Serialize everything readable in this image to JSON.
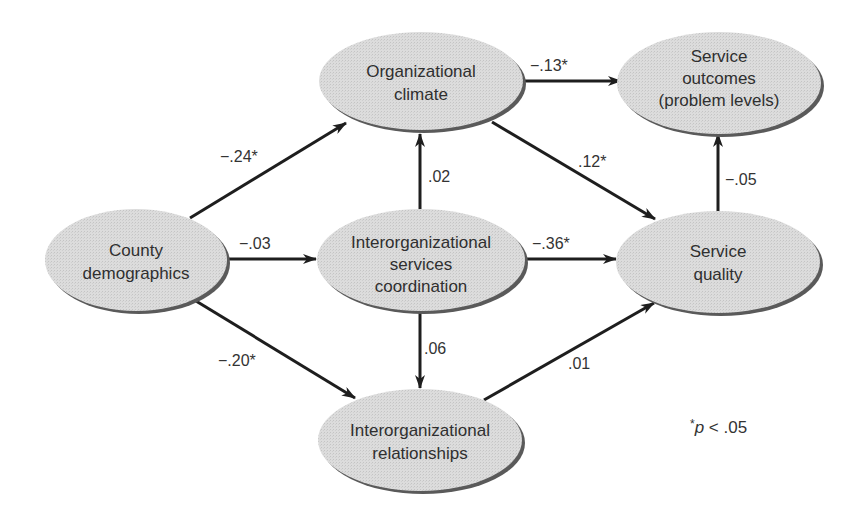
{
  "colors": {
    "node_fill": "#d9d9d9",
    "node_shadow": "#555555",
    "edge": "#1e1e1e",
    "text": "#2f2f2f"
  },
  "nodes": {
    "county": {
      "lines": [
        "County",
        "demographics"
      ]
    },
    "climate": {
      "lines": [
        "Organizational",
        "climate"
      ]
    },
    "outcomes": {
      "lines": [
        "Service",
        "outcomes",
        "(problem levels)"
      ]
    },
    "coordination": {
      "lines": [
        "Interorganizational",
        "services",
        "coordination"
      ]
    },
    "quality": {
      "lines": [
        "Service",
        "quality"
      ]
    },
    "relationships": {
      "lines": [
        "Interorganizational",
        "relationships"
      ]
    }
  },
  "edges": {
    "county_climate": {
      "label": "−.24*"
    },
    "county_coordination": {
      "label": "−.03"
    },
    "county_relationships": {
      "label": "−.20*"
    },
    "coordination_climate": {
      "label": ".02"
    },
    "coordination_relationships": {
      "label": ".06"
    },
    "climate_outcomes": {
      "label": "−.13*"
    },
    "climate_quality": {
      "label": ".12*"
    },
    "coordination_quality": {
      "label": "−.36*"
    },
    "relationships_quality": {
      "label": ".01"
    },
    "quality_outcomes": {
      "label": "−.05"
    }
  },
  "note": {
    "star": "*",
    "p": "p",
    "rest": " < .05"
  }
}
